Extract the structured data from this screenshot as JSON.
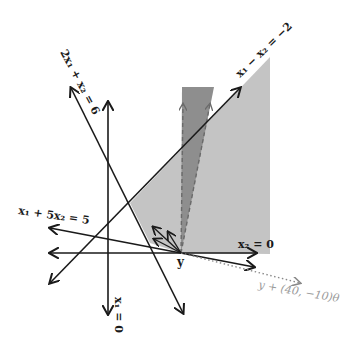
{
  "diagram": {
    "type": "polyhedron-feasible-region",
    "colors": {
      "region_light": "#c4c4c4",
      "region_dark": "#8e8e8e",
      "line": "#1a1a1a",
      "dotted": "#888888",
      "label_gray": "#9a9a9a"
    },
    "labels": {
      "line_2x1_x2": "2x₁ + x₂ = 6",
      "line_x1_minus_x2": "x₁ − x₂ = −2",
      "line_x1_5x2": "x₁ + 5x₂ = 5",
      "line_x2_zero": "x₂ = 0",
      "line_x1_zero": "x₁ = 0",
      "point_y": "y",
      "ray_label": "y + (40, −10)θ"
    },
    "constraints": [
      "2x1 + x2 = 6",
      "x1 - x2 = -2",
      "x1 + 5x2 = 5",
      "x2 = 0",
      "x1 = 0"
    ],
    "point": "y",
    "ray_direction": [
      40,
      -10
    ]
  }
}
